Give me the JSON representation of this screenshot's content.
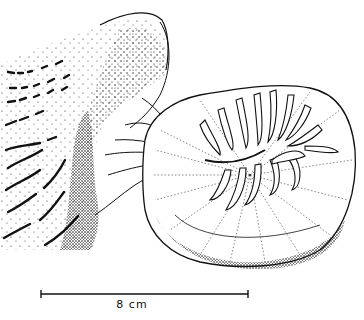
{
  "figure": {
    "scale_bar": {
      "label": "8 cm",
      "x1": 41,
      "x2": 248,
      "y": 294
    },
    "colors": {
      "ink": "#111111",
      "background": "#ffffff"
    }
  }
}
